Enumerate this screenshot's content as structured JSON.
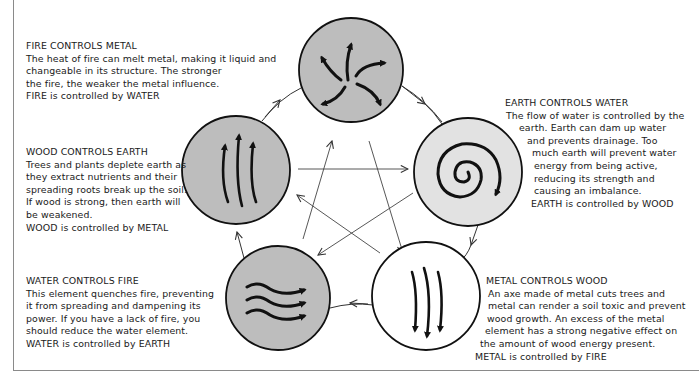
{
  "diagram": {
    "elements": [
      {
        "name": "Fire",
        "fill": "#bdbdbd",
        "symbol": "pinwheel-arrows"
      },
      {
        "name": "Earth",
        "fill": "#e2e2e2",
        "symbol": "spiral-arrow"
      },
      {
        "name": "Metal",
        "fill": "#ffffff",
        "symbol": "downward-arrows"
      },
      {
        "name": "Water",
        "fill": "#bdbdbd",
        "symbol": "wave-arrows"
      },
      {
        "name": "Wood",
        "fill": "#bdbdbd",
        "symbol": "upward-arrows"
      }
    ],
    "cycle_arrows": [
      "Fire→Earth",
      "Earth→Metal",
      "Metal→Water",
      "Water→Wood",
      "Wood→Fire"
    ],
    "star_arrows": [
      "Wood→Earth",
      "Earth→Water",
      "Water→Fire",
      "Fire→Metal",
      "Metal→Wood"
    ]
  },
  "blocks": {
    "fire": {
      "title": "FIRE CONTROLS METAL",
      "lines": [
        "The heat of fire can melt metal, making it liquid and",
        "changeable in its structure. The stronger",
        "the fire, the weaker the metal influence.",
        "FIRE is controlled by WATER"
      ]
    },
    "wood": {
      "title": "WOOD CONTROLS EARTH",
      "lines": [
        "Trees and plants deplete earth as",
        "they extract nutrients and their",
        "spreading roots break up the soil.",
        "If wood is strong, then earth will",
        "be weakened.",
        "WOOD is controlled by METAL"
      ]
    },
    "water": {
      "title": "WATER CONTROLS FIRE",
      "lines": [
        "This element quenches fire, preventing",
        "it from spreading and dampening its",
        "power. If you have a lack of fire, you",
        "should reduce the water element.",
        "WATER is controlled by EARTH"
      ]
    },
    "earth": {
      "title": "EARTH CONTROLS WATER",
      "lines": [
        "The flow of water is controlled by the",
        "earth. Earth can dam up water",
        "and prevents drainage. Too",
        "much earth will prevent water",
        "energy from being active,",
        "reducing its strength and",
        "causing an imbalance.",
        "EARTH is controlled by WOOD"
      ]
    },
    "metal": {
      "title": "METAL CONTROLS WOOD",
      "lines": [
        "An axe made of metal cuts trees and",
        "metal can render a soil toxic and prevent",
        "wood growth. An excess of the metal",
        "element has a strong negative effect on",
        "the amount of wood energy present.",
        "METAL is controlled by FIRE"
      ]
    }
  }
}
